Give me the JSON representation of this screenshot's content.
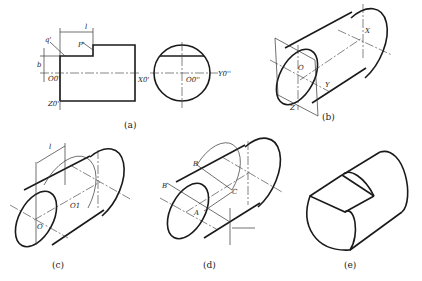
{
  "figure": {
    "panels": [
      {
        "id": "a",
        "caption": "(a)",
        "labels": {
          "q": "q'",
          "p": "P'",
          "l": "l",
          "b": "b",
          "o": "O0'",
          "x": "X0'",
          "z": "Z0'",
          "o2": "O0''",
          "y": "Y0''"
        }
      },
      {
        "id": "b",
        "caption": "(b)",
        "labels": {
          "o": "O",
          "x": "X",
          "y": "Y",
          "z": "Z"
        }
      },
      {
        "id": "c",
        "caption": "(c)",
        "labels": {
          "l": "l",
          "o": "O",
          "o1": "O1"
        }
      },
      {
        "id": "d",
        "caption": "(d)",
        "labels": {
          "b1": "B",
          "b2": "B",
          "a": "A",
          "c": "C"
        }
      },
      {
        "id": "e",
        "caption": "(e)"
      }
    ]
  }
}
